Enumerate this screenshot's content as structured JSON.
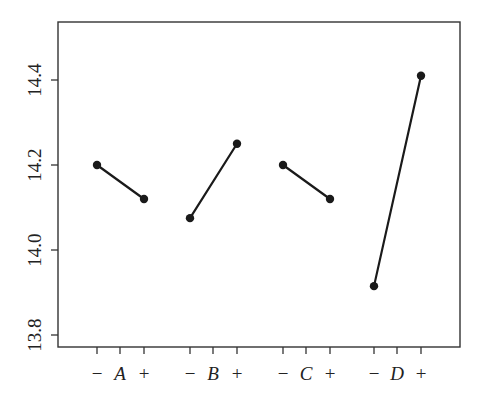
{
  "chart_data": {
    "type": "line",
    "title": "",
    "subtitle": "",
    "xlabel": "",
    "ylabel": "",
    "ylim": [
      13.775,
      14.54
    ],
    "yticks": [
      13.8,
      14.0,
      14.2,
      14.4
    ],
    "ytick_labels": [
      "13.8",
      "14.0",
      "14.2",
      "14.4"
    ],
    "grid": false,
    "legend": null,
    "categories": [
      "-",
      "+"
    ],
    "factors": [
      {
        "name": "A",
        "low_label": "−",
        "high_label": "+",
        "values": [
          14.2,
          14.12
        ]
      },
      {
        "name": "B",
        "low_label": "−",
        "high_label": "+",
        "values": [
          14.075,
          14.25
        ]
      },
      {
        "name": "C",
        "low_label": "−",
        "high_label": "+",
        "values": [
          14.2,
          14.12
        ]
      },
      {
        "name": "D",
        "low_label": "−",
        "high_label": "+",
        "values": [
          13.915,
          14.41
        ]
      }
    ],
    "series": [
      {
        "name": "A",
        "x": [
          "-",
          "+"
        ],
        "values": [
          14.2,
          14.12
        ]
      },
      {
        "name": "B",
        "x": [
          "-",
          "+"
        ],
        "values": [
          14.075,
          14.25
        ]
      },
      {
        "name": "C",
        "x": [
          "-",
          "+"
        ],
        "values": [
          14.2,
          14.12
        ]
      },
      {
        "name": "D",
        "x": [
          "-",
          "+"
        ],
        "values": [
          13.915,
          14.41
        ]
      }
    ]
  },
  "layout": {
    "frame": {
      "left": 58,
      "top": 22,
      "right": 460,
      "bottom": 347
    },
    "y_pixel_ref": {
      "value_a": 14.4,
      "px_a": 80,
      "value_b": 13.8,
      "px_b": 335
    },
    "factor_x_positions": [
      {
        "minus": 97,
        "center": 120,
        "plus": 144
      },
      {
        "minus": 190,
        "center": 213,
        "plus": 237
      },
      {
        "minus": 283,
        "center": 306,
        "plus": 330
      },
      {
        "minus": 374,
        "center": 397,
        "plus": 421
      }
    ]
  },
  "colors": {
    "line": "#1a1a1a",
    "axis": "#333333",
    "text": "#222222",
    "background": "#ffffff"
  }
}
